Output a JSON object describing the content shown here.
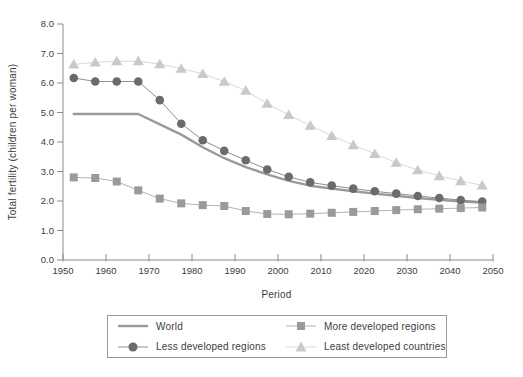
{
  "page": {
    "background": "#ffffff"
  },
  "axes": {
    "line_color": "#8c8c8c",
    "text_color": "#3d3d3d",
    "tick_font_px": 9.5
  },
  "chart_data": {
    "type": "line",
    "title": "",
    "xlabel": "Period",
    "ylabel": "Total fertility (children per woman)",
    "xlim": [
      1950,
      2050
    ],
    "ylim": [
      0.0,
      8.0
    ],
    "grid": false,
    "legend_position": "bottom-box",
    "x_tick_labels": [
      "1950",
      "1960",
      "1970",
      "1980",
      "1990",
      "2000",
      "2010",
      "2020",
      "2030",
      "2040",
      "2050"
    ],
    "y_tick_labels": [
      "0.0",
      "1.0",
      "2.0",
      "3.0",
      "4.0",
      "5.0",
      "6.0",
      "7.0",
      "8.0"
    ],
    "x": [
      1952.5,
      1957.5,
      1962.5,
      1967.5,
      1972.5,
      1977.5,
      1982.5,
      1987.5,
      1992.5,
      1997.5,
      2002.5,
      2007.5,
      2012.5,
      2017.5,
      2022.5,
      2027.5,
      2032.5,
      2037.5,
      2042.5,
      2047.5
    ],
    "series": [
      {
        "name": "World",
        "marker": "none",
        "color": "#9a9a9a",
        "line_color": "#9a9a9a",
        "line_width": 2.4,
        "values": [
          4.95,
          4.95,
          4.95,
          4.95,
          4.6,
          4.25,
          3.82,
          3.45,
          3.15,
          2.9,
          2.68,
          2.52,
          2.42,
          2.33,
          2.25,
          2.18,
          2.1,
          2.04,
          1.98,
          1.95
        ]
      },
      {
        "name": "Less developed regions",
        "marker": "circle",
        "color": "#6b6b6b",
        "line_color": "#8f8f8f",
        "line_width": 1,
        "values": [
          6.17,
          6.05,
          6.05,
          6.05,
          5.42,
          4.62,
          4.06,
          3.7,
          3.38,
          3.07,
          2.82,
          2.63,
          2.52,
          2.42,
          2.33,
          2.25,
          2.17,
          2.1,
          2.03,
          1.98
        ]
      },
      {
        "name": "More developed regions",
        "marker": "square",
        "color": "#9a9a9a",
        "line_color": "#b3b3b3",
        "line_width": 1,
        "values": [
          2.8,
          2.78,
          2.66,
          2.36,
          2.08,
          1.92,
          1.86,
          1.83,
          1.66,
          1.56,
          1.55,
          1.57,
          1.6,
          1.63,
          1.66,
          1.69,
          1.72,
          1.74,
          1.76,
          1.78
        ]
      },
      {
        "name": "Least developed countries",
        "marker": "triangle",
        "color": "#c9c9c9",
        "line_color": "#d8d8d8",
        "line_width": 1,
        "values": [
          6.63,
          6.7,
          6.74,
          6.74,
          6.64,
          6.49,
          6.31,
          6.05,
          5.74,
          5.3,
          4.92,
          4.56,
          4.21,
          3.9,
          3.6,
          3.3,
          3.05,
          2.85,
          2.68,
          2.53
        ]
      }
    ]
  }
}
